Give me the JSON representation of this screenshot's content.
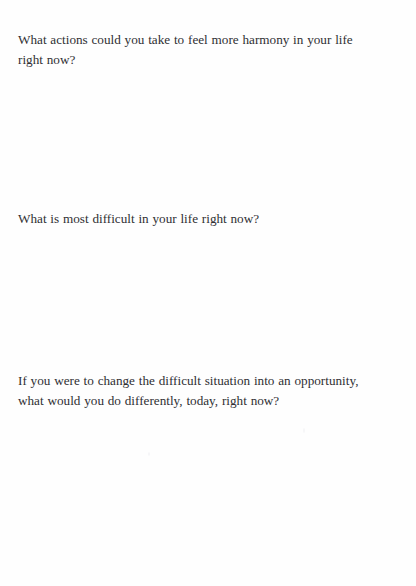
{
  "page": {
    "running_header": "",
    "background_color": "#fefefe",
    "text_color": "#2f2f33"
  },
  "questions": [
    {
      "id": "q1",
      "line_1": "What actions could you take to feel more harmony in your life",
      "line_2": "right now?"
    },
    {
      "id": "q2",
      "line_1": "What is most difficult in your life right now?"
    },
    {
      "id": "q3",
      "line_1": "If you were to change the difficult situation into an opportunity,",
      "line_2": "what would you do differently, today, right now?"
    }
  ],
  "answer_spaces": [
    {
      "id": "space1",
      "label": ""
    },
    {
      "id": "space2",
      "label": ""
    },
    {
      "id": "space3",
      "label": ""
    }
  ]
}
